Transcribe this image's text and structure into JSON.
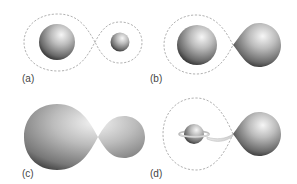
{
  "figure": {
    "colors": {
      "background": "#ffffff",
      "roche_lobe_stroke": "#a8a8a8",
      "star_highlight": "#f4f4f4",
      "star_mid": "#9a9a9a",
      "star_shadow": "#1e1e1e",
      "label": "#444444"
    },
    "panels": [
      {
        "id": "a",
        "label": "(a)",
        "description": "Detached binary: both stars within Roche lobes"
      },
      {
        "id": "b",
        "label": "(b)",
        "description": "Semi-detached binary: one star fills its Roche lobe"
      },
      {
        "id": "c",
        "label": "(c)",
        "description": "Contact binary: stars share a common envelope"
      },
      {
        "id": "d",
        "label": "(d)",
        "description": "Mass transfer via stream onto accretion disk around companion"
      }
    ]
  }
}
